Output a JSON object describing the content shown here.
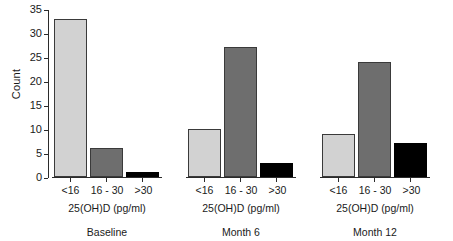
{
  "chart_data": {
    "type": "bar",
    "title": "",
    "xlabel": "25(OH)D (pg/ml)",
    "ylabel": "Count",
    "ylim": [
      0,
      35
    ],
    "yticks": [
      0,
      5,
      10,
      15,
      20,
      25,
      30,
      35
    ],
    "grid": false,
    "legend": "none",
    "categories": [
      "<16",
      "16 - 30",
      ">30"
    ],
    "panels": [
      {
        "name": "Baseline",
        "values": [
          33,
          6,
          1
        ]
      },
      {
        "name": "Month 6",
        "values": [
          10,
          27,
          3
        ]
      },
      {
        "name": "Month 12",
        "values": [
          9,
          24,
          7
        ]
      }
    ],
    "series": [
      {
        "name": "<16",
        "values": [
          33,
          10,
          9
        ]
      },
      {
        "name": "16 - 30",
        "values": [
          6,
          27,
          24
        ]
      },
      {
        "name": ">30",
        "values": [
          1,
          3,
          7
        ]
      }
    ],
    "colors": {
      "bar_lt16": "#d2d2d2",
      "bar_16_30": "#6e6e6e",
      "bar_gt30": "#000000",
      "axis": "#2b2b2b",
      "background": "#ffffff"
    }
  }
}
